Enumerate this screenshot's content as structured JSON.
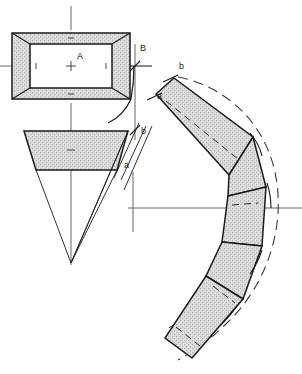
{
  "drawing": {
    "title": "Development of a tapered rectangular transition piece",
    "background_color": "#ffffff",
    "line_color": "#1a1a1a",
    "fill_color": "#d4d4d4",
    "centerline_color": "#4a4a4a",
    "views": {
      "plan": {
        "name": "Top view (plan) of rectangular frustum",
        "outer_rect": {
          "x": 12,
          "y": 33,
          "w": 118,
          "h": 66
        },
        "inner_rect": {
          "x": 30,
          "y": 44,
          "w": 82,
          "h": 44
        },
        "center_label": "A",
        "center_point": {
          "x": 71,
          "y": 66
        }
      },
      "elevation": {
        "name": "Front view (elevation) trapezoid",
        "top_y": 131,
        "bottom_y": 170,
        "top_left_x": 24,
        "top_right_x": 128,
        "bottom_left_x": 36,
        "bottom_right_x": 117,
        "apex": {
          "x": 71,
          "y": 263
        }
      },
      "development": {
        "name": "Flat pattern development (unrolled band)",
        "origin": {
          "x": 133,
          "y": 208
        },
        "start_label_outer": "b",
        "start_label_inner": "a"
      }
    },
    "labels": [
      {
        "id": "label-A",
        "text": "A",
        "x": 77,
        "y": 58
      },
      {
        "id": "label-B",
        "text": "B",
        "x": 142,
        "y": 50
      },
      {
        "id": "label-b-elevation",
        "text": "b",
        "x": 142,
        "y": 131
      },
      {
        "id": "label-a-elevation",
        "text": "a",
        "x": 126,
        "y": 166
      },
      {
        "id": "label-b-development",
        "text": "b",
        "x": 181,
        "y": 60
      },
      {
        "id": "label-a-development",
        "text": "a",
        "x": 158,
        "y": 96
      }
    ]
  }
}
